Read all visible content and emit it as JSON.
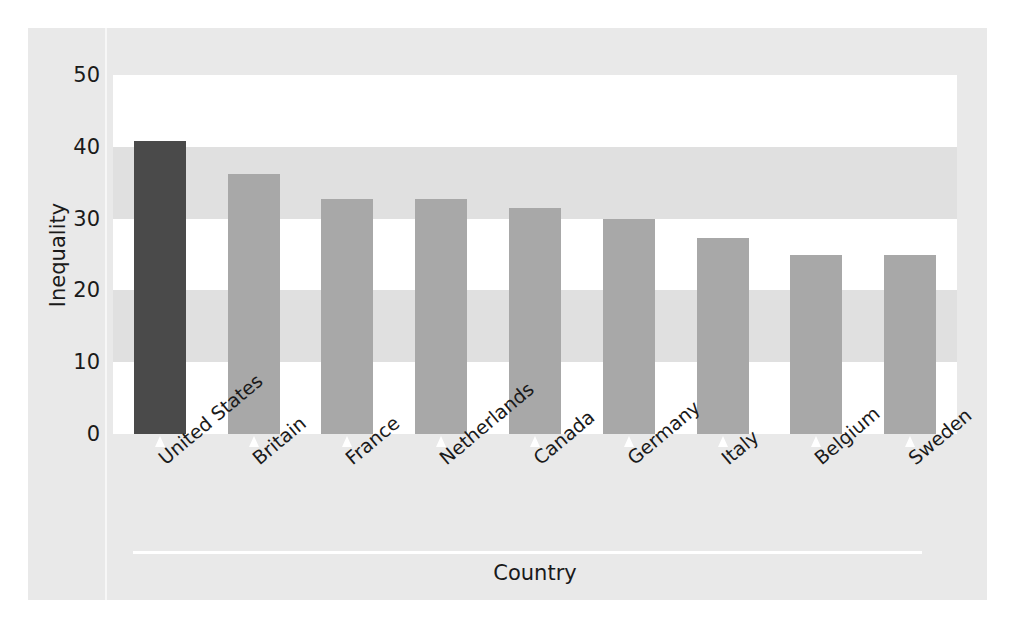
{
  "chart_data": {
    "type": "bar",
    "title": "",
    "xlabel": "Country",
    "ylabel": "Inequality",
    "categories": [
      "United States",
      "Britain",
      "France",
      "Netherlands",
      "Canada",
      "Germany",
      "Italy",
      "Belgium",
      "Sweden"
    ],
    "values": [
      40.8,
      36.2,
      32.8,
      32.7,
      31.5,
      30.0,
      27.3,
      25.0,
      25.0
    ],
    "ylim": [
      0,
      50
    ],
    "yticks": [
      0,
      10,
      20,
      30,
      40,
      50
    ],
    "ytick_labels": [
      "0",
      "10",
      "20",
      "30",
      "40",
      "50"
    ],
    "grid": false,
    "banded_background": true,
    "band_interval": 10,
    "legend": "none",
    "highlight_category": "United States",
    "colors": {
      "highlight_bar": "#4a4a4a",
      "bar": "#a8a8a8",
      "figure_background": "#e9e9e9",
      "plot_background": "#ffffff",
      "band_shade": "#e0e0e0",
      "text": "#1a1a1a",
      "axis_rule": "#ffffff"
    }
  }
}
